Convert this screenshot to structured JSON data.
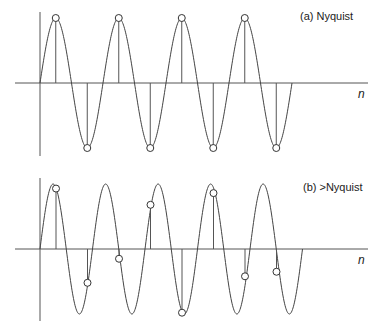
{
  "panels": [
    {
      "id": "a",
      "label": "(a)  Nyquist",
      "axis_label": "n",
      "signal_cycles_per_sample": 0.5,
      "signal_cycles_shown": 4,
      "samples": [
        1,
        -1,
        1,
        -1,
        1,
        -1,
        1,
        -1
      ]
    },
    {
      "id": "b",
      "label": "(b)  >Nyquist",
      "axis_label": "n",
      "signal_cycles_per_sample": 0.6,
      "signal_cycles_shown": 5,
      "samples": [
        0.93,
        -0.52,
        -0.15,
        0.68,
        -0.98,
        0.86,
        -0.42,
        -0.35
      ]
    }
  ]
}
